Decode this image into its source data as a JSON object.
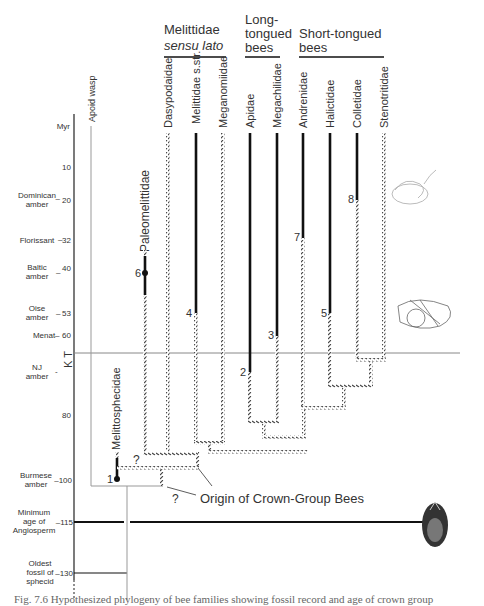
{
  "groups": {
    "melittidae": {
      "line1": "Melittidae",
      "line2": "sensu lato"
    },
    "long_tongued": {
      "line1": "Long-",
      "line2": "tongued",
      "line3": "bees"
    },
    "short_tongued": {
      "line1": "Short-tongued",
      "line2": "bees"
    }
  },
  "taxa": [
    {
      "name": "Dasypodaidae",
      "x": 168,
      "solid": false
    },
    {
      "name": "Melittidae s.str.",
      "x": 196,
      "solid": true,
      "fossil_number": "4"
    },
    {
      "name": "Meganomiidae",
      "x": 223,
      "solid": false
    },
    {
      "name": "Apidae",
      "x": 250,
      "solid": true,
      "fossil_number": "2"
    },
    {
      "name": "Megachilidae",
      "x": 277,
      "solid": true,
      "fossil_number": "3"
    },
    {
      "name": "Andrenidae",
      "x": 303,
      "solid": true,
      "fossil_number": "7"
    },
    {
      "name": "Halictidae",
      "x": 330,
      "solid": true,
      "fossil_number": "5"
    },
    {
      "name": "Colletidae",
      "x": 357,
      "solid": true,
      "fossil_number": "8"
    },
    {
      "name": "Stenotritidae",
      "x": 384,
      "solid": false
    }
  ],
  "extinct_taxa": [
    {
      "name": "Paleomelittidae",
      "fossil_number": "6"
    },
    {
      "name": "Melittosphecidae",
      "fossil_number": "1"
    }
  ],
  "outgroup": {
    "label": "Apoid wasp"
  },
  "time_axis": {
    "unit": "Myr",
    "ticks": [
      {
        "value": "10",
        "label": ""
      },
      {
        "value": "20",
        "label": "Dominican amber"
      },
      {
        "value": "32",
        "label": "Florissant"
      },
      {
        "value": "40",
        "label": "Baltic amber"
      },
      {
        "value": "53",
        "label": "Oise amber"
      },
      {
        "value": "60",
        "label": "Menat"
      },
      {
        "value": "",
        "label": "NJ amber"
      },
      {
        "value": "80",
        "label": ""
      },
      {
        "value": "100",
        "label": "Burmese amber"
      },
      {
        "value": "115",
        "label": "Minimum age of Angiosperm"
      },
      {
        "value": "130",
        "label": "Oldest fossil of sphecid"
      }
    ],
    "kt_boundary": "K | T"
  },
  "annotations": {
    "origin": "Origin of Crown-Group Bees",
    "question": "?"
  },
  "caption": "Fig. 7.6  Hypothesized phylogeny of bee families showing fossil record and age of crown group"
}
